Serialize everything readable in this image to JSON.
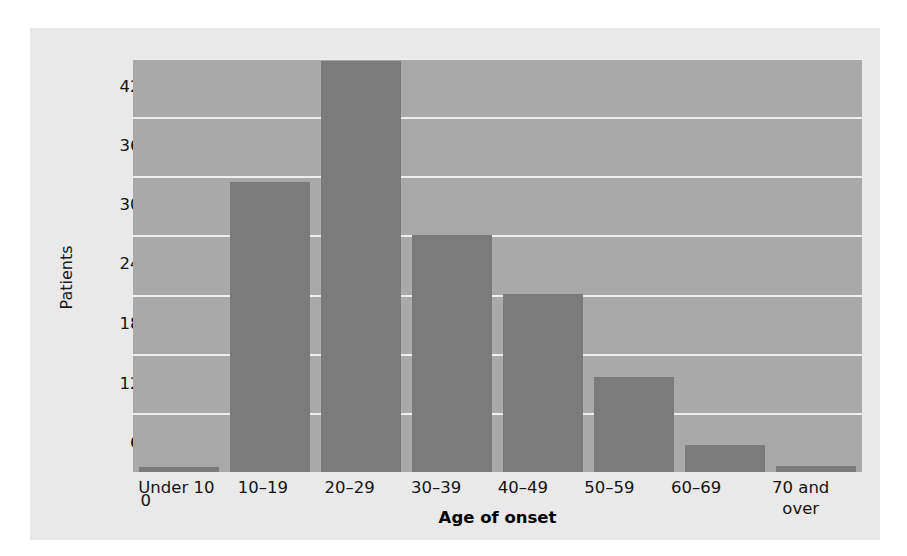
{
  "chart_data": {
    "type": "bar",
    "title": "",
    "subtitle": "",
    "xlabel": "Age of onset",
    "ylabel": "Patients",
    "categories": [
      "Under 10",
      "10–19",
      "20–29",
      "30–39",
      "40–49",
      "50–59",
      "60–69",
      "70 and over"
    ],
    "values": [
      5,
      294,
      417,
      240,
      181,
      96,
      27,
      6
    ],
    "series": [
      {
        "name": "Patients",
        "values": [
          5,
          294,
          417,
          240,
          181,
          96,
          27,
          6
        ]
      }
    ],
    "ylim": [
      0,
      420
    ],
    "yticks": [
      0,
      60,
      120,
      180,
      240,
      300,
      360,
      420
    ],
    "ytick_labels": [
      "0",
      "60",
      "120",
      "180",
      "240",
      "300",
      "360",
      "420"
    ],
    "xtick_labels": [
      "Under 10",
      "10–19",
      "20–29",
      "30–39",
      "40–49",
      "50–59",
      "60–69",
      "70 and\nover"
    ],
    "grid": true,
    "grid_axis": "y",
    "legend": false,
    "legend_position": "none",
    "colors": {
      "bar": "#7b7b7b",
      "plot_background": "#a9a9a9",
      "figure_background": "#e9e9e9",
      "gridline": "#eeeeee",
      "text": "#141414",
      "page_background": "#ffffff"
    }
  }
}
